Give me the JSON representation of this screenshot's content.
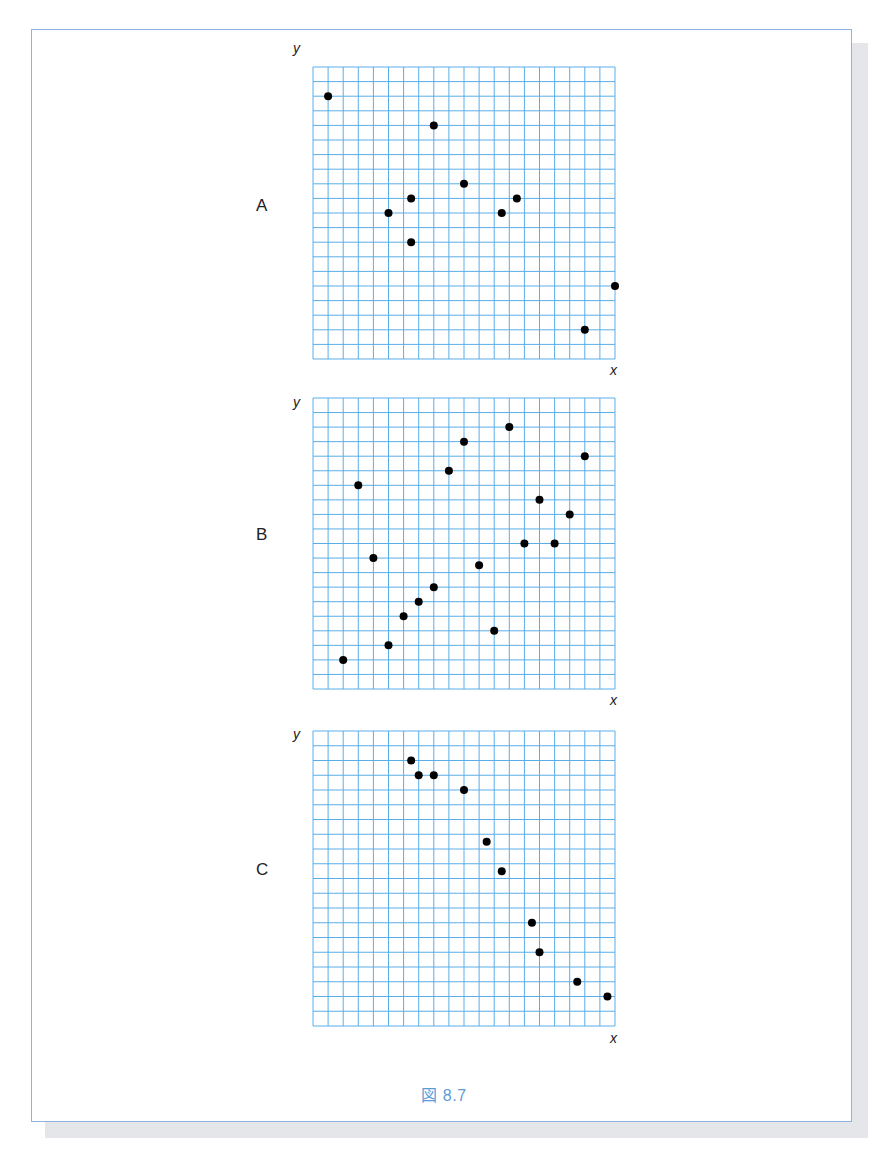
{
  "figure": {
    "caption": "図 8.7"
  },
  "colors": {
    "grid": "#5aaee8",
    "point": "#000000",
    "frame": "#8fb3e0",
    "caption": "#5b9bd8"
  },
  "chart_data": [
    {
      "type": "scatter",
      "title": "A",
      "xlabel": "x",
      "ylabel": "y",
      "xlim": [
        0,
        20
      ],
      "ylim": [
        0,
        20
      ],
      "grid": true,
      "points": [
        [
          1,
          18
        ],
        [
          8,
          16
        ],
        [
          10,
          12
        ],
        [
          6.5,
          11
        ],
        [
          5,
          10
        ],
        [
          6.5,
          8
        ],
        [
          12.5,
          10
        ],
        [
          13.5,
          11
        ],
        [
          20,
          5
        ],
        [
          18,
          2
        ]
      ]
    },
    {
      "type": "scatter",
      "title": "B",
      "xlabel": "x",
      "ylabel": "y",
      "xlim": [
        0,
        20
      ],
      "ylim": [
        0,
        20
      ],
      "grid": true,
      "points": [
        [
          2,
          2
        ],
        [
          3,
          14
        ],
        [
          4,
          9
        ],
        [
          5,
          3
        ],
        [
          6,
          5
        ],
        [
          7,
          6
        ],
        [
          8,
          7
        ],
        [
          9,
          15
        ],
        [
          10,
          17
        ],
        [
          11,
          8.5
        ],
        [
          12,
          4
        ],
        [
          13,
          18
        ],
        [
          14,
          10
        ],
        [
          15,
          13
        ],
        [
          16,
          10
        ],
        [
          17,
          12
        ],
        [
          18,
          16
        ]
      ]
    },
    {
      "type": "scatter",
      "title": "C",
      "xlabel": "x",
      "ylabel": "y",
      "xlim": [
        0,
        20
      ],
      "ylim": [
        0,
        20
      ],
      "grid": true,
      "points": [
        [
          6.5,
          18
        ],
        [
          7,
          17
        ],
        [
          8,
          17
        ],
        [
          10,
          16
        ],
        [
          11.5,
          12.5
        ],
        [
          12.5,
          10.5
        ],
        [
          14.5,
          7
        ],
        [
          15,
          5
        ],
        [
          17.5,
          3
        ],
        [
          19.5,
          2
        ]
      ]
    }
  ],
  "panels": [
    {
      "label": "A",
      "xlabel": "x",
      "ylabel": "y"
    },
    {
      "label": "B",
      "xlabel": "x",
      "ylabel": "y"
    },
    {
      "label": "C",
      "xlabel": "x",
      "ylabel": "y"
    }
  ]
}
